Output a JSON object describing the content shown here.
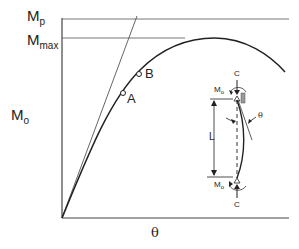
{
  "diagram": {
    "type": "moment-rotation curve",
    "y_axis_label": {
      "main": "M",
      "sub": "o"
    },
    "x_axis_label": "θ",
    "levels": [
      {
        "name": "Mp",
        "main": "M",
        "sub": "p"
      },
      {
        "name": "Mmax",
        "main": "M",
        "sub": "max"
      }
    ],
    "points": [
      {
        "label": "A"
      },
      {
        "label": "B"
      }
    ],
    "inset": {
      "top_load": "C",
      "bottom_load": "C",
      "top_moment": {
        "main": "M",
        "sub": "o"
      },
      "bottom_moment": {
        "main": "M",
        "sub": "o"
      },
      "length": "L",
      "rotation": "θ"
    }
  },
  "colors": {
    "line": "#333333",
    "text": "#222222",
    "background": "#ffffff"
  }
}
